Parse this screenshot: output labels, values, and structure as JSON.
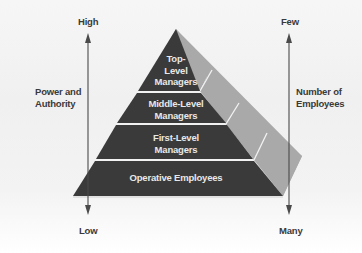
{
  "diagram": {
    "type": "pyramid",
    "left_axis": {
      "top_label": "High",
      "bottom_label": "Low",
      "title_line1": "Power and",
      "title_line2": "Authority"
    },
    "right_axis": {
      "top_label": "Few",
      "bottom_label": "Many",
      "title_line1": "Number of",
      "title_line2": "Employees"
    },
    "levels": [
      {
        "label": "Top-\nLevel\nManagers"
      },
      {
        "label": "Middle-Level\nManagers"
      },
      {
        "label": "First-Level\nManagers"
      },
      {
        "label": "Operative Employees"
      }
    ],
    "colors": {
      "front_face": "#3a3a3a",
      "side_face": "#a9a9a9",
      "divider": "#f2f2f2",
      "arrow": "#4a4a4a",
      "text_dark": "#3a3a3a",
      "text_light": "#e8e8e8"
    }
  }
}
